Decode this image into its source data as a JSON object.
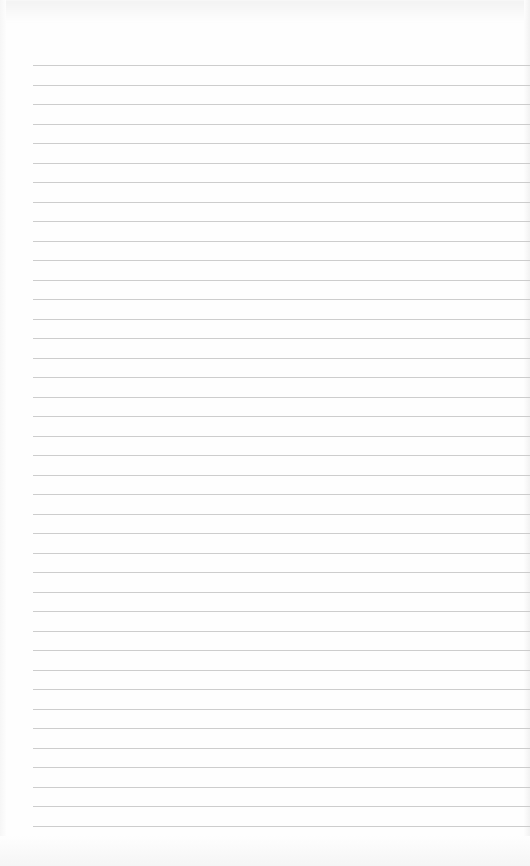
{
  "page": {
    "type": "blank-lined-notebook-paper",
    "background_color": "#fefefe",
    "rule_color": "#c4c4c4",
    "rule_start_x": 33,
    "first_rule_y": 65,
    "rule_spacing": 19.5,
    "rule_count": 40
  }
}
